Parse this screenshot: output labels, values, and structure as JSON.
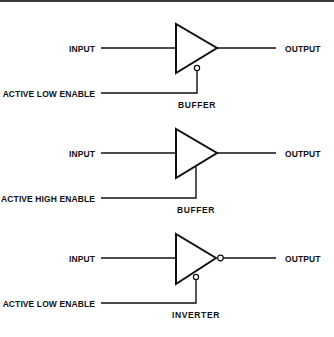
{
  "diagram": {
    "type": "tri-state logic symbols",
    "gates": [
      {
        "input_label": "INPUT",
        "output_label": "OUTPUT",
        "enable_label": "ACTIVE LOW ENABLE",
        "caption": "BUFFER",
        "enable_inverted": true,
        "output_inverted": false
      },
      {
        "input_label": "INPUT",
        "output_label": "OUTPUT",
        "enable_label": "ACTIVE HIGH ENABLE",
        "caption": "BUFFER",
        "enable_inverted": false,
        "output_inverted": false
      },
      {
        "input_label": "INPUT",
        "output_label": "OUTPUT",
        "enable_label": "ACTIVE LOW ENABLE",
        "caption": "INVERTER",
        "enable_inverted": true,
        "output_inverted": true
      }
    ]
  }
}
